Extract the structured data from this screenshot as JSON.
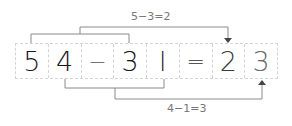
{
  "equation": {
    "cells": [
      "5",
      "4",
      "−",
      "3",
      "l",
      "=",
      "2",
      "3"
    ]
  },
  "annotations": {
    "top_label": "5−3=2",
    "bottom_label": "4−1=3"
  },
  "colors": {
    "line": "#8a8a8a",
    "border": "#d4d4d4",
    "digit": "#1a1a1a"
  }
}
